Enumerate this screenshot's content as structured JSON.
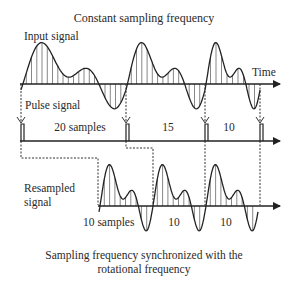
{
  "title": "Constant sampling frequency",
  "labels": {
    "input_signal": "Input signal",
    "time": "Time",
    "pulse_signal": "Pulse signal",
    "resampled_line1": "Resampled",
    "resampled_line2": "signal"
  },
  "pulse_segments": [
    {
      "label": "20 samples"
    },
    {
      "label": "15"
    },
    {
      "label": "10"
    }
  ],
  "resampled_segments": [
    {
      "label": "10 samples"
    },
    {
      "label": "10"
    },
    {
      "label": "10"
    }
  ],
  "caption_line1": "Sampling frequency synchronized with the",
  "caption_line2": "rotational frequency",
  "colors": {
    "line": "#222222",
    "dotted": "#333333"
  }
}
